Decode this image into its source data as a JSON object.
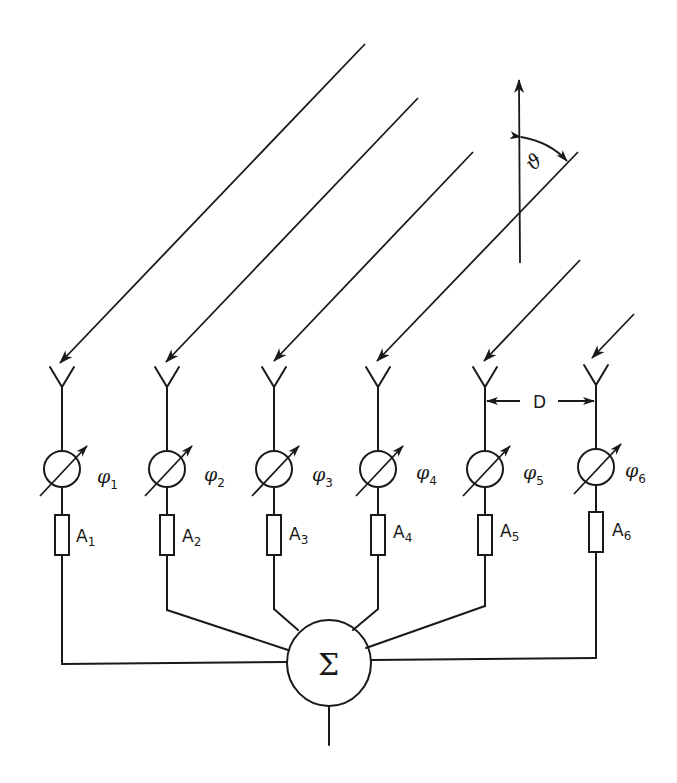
{
  "diagram": {
    "elements": [
      {
        "index": 1,
        "phase_label": "φ",
        "phase_sub": "1",
        "amp_label": "A",
        "amp_sub": "1"
      },
      {
        "index": 2,
        "phase_label": "φ",
        "phase_sub": "2",
        "amp_label": "A",
        "amp_sub": "2"
      },
      {
        "index": 3,
        "phase_label": "φ",
        "phase_sub": "3",
        "amp_label": "A",
        "amp_sub": "3"
      },
      {
        "index": 4,
        "phase_label": "φ",
        "phase_sub": "4",
        "amp_label": "A",
        "amp_sub": "4"
      },
      {
        "index": 5,
        "phase_label": "φ",
        "phase_sub": "5",
        "amp_label": "A",
        "amp_sub": "5"
      },
      {
        "index": 6,
        "phase_label": "φ",
        "phase_sub": "6",
        "amp_label": "A",
        "amp_sub": "6"
      }
    ],
    "spacing_label": "D",
    "angle_label": "ϑ",
    "summer_label": "Σ",
    "colors": {
      "ink": "#1a1a1a",
      "background": "#ffffff"
    }
  }
}
